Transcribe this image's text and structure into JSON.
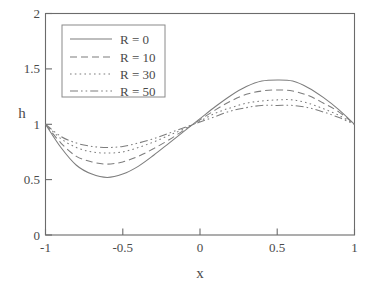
{
  "chart_data": {
    "type": "line",
    "title": "",
    "xlabel": "x",
    "ylabel": "h",
    "xlim": [
      -1,
      1
    ],
    "ylim": [
      0,
      2
    ],
    "xticks": [
      "-1",
      "-0.5",
      "0",
      "0.5",
      "1"
    ],
    "xtick_values": [
      -1,
      -0.5,
      0,
      0.5,
      1
    ],
    "yticks": [
      "0",
      "0.5",
      "1",
      "1.5",
      "2"
    ],
    "ytick_values": [
      0,
      0.5,
      1,
      1.5,
      2
    ],
    "grid": false,
    "legend_position": "upper-left",
    "series": [
      {
        "name": "R = 0",
        "style": "solid",
        "amplitude": 0.44,
        "min_value": 0.52,
        "min_at_x": -0.6,
        "max_value": 1.4,
        "max_at_x": 0.55,
        "x": [
          -1,
          -0.9,
          -0.8,
          -0.7,
          -0.6,
          -0.5,
          -0.4,
          -0.3,
          -0.2,
          -0.1,
          0,
          0.1,
          0.2,
          0.3,
          0.4,
          0.5,
          0.6,
          0.7,
          0.8,
          0.9,
          1
        ],
        "values": [
          1.0,
          0.79,
          0.63,
          0.55,
          0.52,
          0.55,
          0.62,
          0.72,
          0.83,
          0.94,
          1.05,
          1.16,
          1.26,
          1.34,
          1.39,
          1.4,
          1.39,
          1.33,
          1.24,
          1.13,
          1.0
        ]
      },
      {
        "name": "R = 10",
        "style": "dashed",
        "amplitude": 0.34,
        "min_value": 0.64,
        "min_at_x": -0.58,
        "max_value": 1.31,
        "max_at_x": 0.57,
        "x": [
          -1,
          -0.9,
          -0.8,
          -0.7,
          -0.6,
          -0.5,
          -0.4,
          -0.3,
          -0.2,
          -0.1,
          0,
          0.1,
          0.2,
          0.3,
          0.4,
          0.5,
          0.6,
          0.7,
          0.8,
          0.9,
          1
        ],
        "values": [
          1.0,
          0.83,
          0.71,
          0.66,
          0.64,
          0.66,
          0.71,
          0.78,
          0.86,
          0.95,
          1.04,
          1.13,
          1.21,
          1.27,
          1.3,
          1.31,
          1.3,
          1.26,
          1.19,
          1.11,
          1.0
        ]
      },
      {
        "name": "R = 30",
        "style": "dotted",
        "amplitude": 0.24,
        "min_value": 0.74,
        "min_at_x": -0.56,
        "max_value": 1.22,
        "max_at_x": 0.58,
        "x": [
          -1,
          -0.9,
          -0.8,
          -0.7,
          -0.6,
          -0.5,
          -0.4,
          -0.3,
          -0.2,
          -0.1,
          0,
          0.1,
          0.2,
          0.3,
          0.4,
          0.5,
          0.6,
          0.7,
          0.8,
          0.9,
          1
        ],
        "values": [
          1.0,
          0.87,
          0.79,
          0.75,
          0.74,
          0.75,
          0.79,
          0.84,
          0.9,
          0.96,
          1.03,
          1.1,
          1.15,
          1.19,
          1.21,
          1.22,
          1.22,
          1.19,
          1.14,
          1.08,
          1.0
        ]
      },
      {
        "name": "R = 50",
        "style": "dashdot",
        "amplitude": 0.19,
        "min_value": 0.79,
        "min_at_x": -0.55,
        "max_value": 1.17,
        "max_at_x": 0.59,
        "x": [
          -1,
          -0.9,
          -0.8,
          -0.7,
          -0.6,
          -0.5,
          -0.4,
          -0.3,
          -0.2,
          -0.1,
          0,
          0.1,
          0.2,
          0.3,
          0.4,
          0.5,
          0.6,
          0.7,
          0.8,
          0.9,
          1
        ],
        "values": [
          1.0,
          0.89,
          0.83,
          0.8,
          0.79,
          0.8,
          0.83,
          0.87,
          0.92,
          0.97,
          1.02,
          1.07,
          1.12,
          1.15,
          1.17,
          1.17,
          1.17,
          1.15,
          1.11,
          1.06,
          1.0
        ]
      }
    ]
  },
  "legend": {
    "entries": [
      {
        "label": "R = 0"
      },
      {
        "label": "R = 10"
      },
      {
        "label": "R = 30"
      },
      {
        "label": "R = 50"
      }
    ]
  },
  "axes": {
    "x_title": "x",
    "y_title": "h"
  },
  "colors": {
    "curve": "#7d7d7d",
    "frame": "#6b6b6b",
    "text": "#4a4a4a",
    "background": "#ffffff"
  }
}
